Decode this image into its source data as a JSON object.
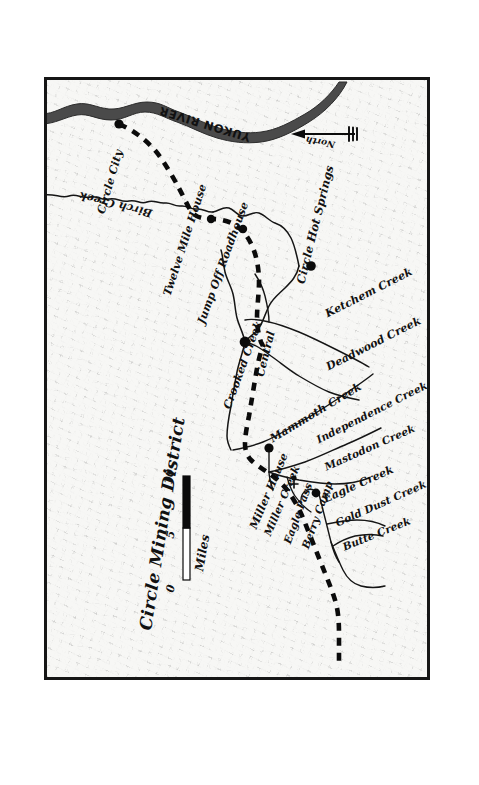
{
  "map": {
    "title": "Circle Mining District",
    "compass": {
      "label": "North",
      "direction": "left",
      "icon": "north-arrow-icon"
    },
    "scale_bar": {
      "unit": "Miles",
      "ticks": [
        "0",
        "5",
        "10"
      ],
      "segments": [
        {
          "from": "0",
          "to": "5",
          "fill": "white"
        },
        {
          "from": "5",
          "to": "10",
          "fill": "black"
        }
      ]
    },
    "water_features": [
      {
        "name": "YUKON RIVER",
        "type": "river",
        "style": "wide-filled"
      },
      {
        "name": "Birch Creek",
        "type": "creek"
      },
      {
        "name": "Crooked Creek",
        "type": "creek"
      },
      {
        "name": "Ketchem Creek",
        "type": "creek"
      },
      {
        "name": "Deadwood Creek",
        "type": "creek"
      },
      {
        "name": "Mammoth Creek",
        "type": "creek"
      },
      {
        "name": "Independence Creek",
        "type": "creek"
      },
      {
        "name": "Mastodon Creek",
        "type": "creek"
      },
      {
        "name": "Eagle Creek",
        "type": "creek"
      },
      {
        "name": "Gold Dust Creek",
        "type": "creek"
      },
      {
        "name": "Butte Creek",
        "type": "creek"
      },
      {
        "name": "Miller Creek",
        "type": "creek"
      }
    ],
    "settlements": [
      {
        "name": "Circle City",
        "marker": "dot"
      },
      {
        "name": "Twelve Mile House",
        "marker": "dot"
      },
      {
        "name": "Jump Off Roadhouse",
        "marker": "dot"
      },
      {
        "name": "Central",
        "marker": "dot"
      },
      {
        "name": "Circle Hot Springs",
        "marker": "dot"
      },
      {
        "name": "Miller House",
        "marker": "dot"
      },
      {
        "name": "Eagle Pass",
        "marker": "pass-symbol"
      },
      {
        "name": "Berry Camp",
        "marker": "dot"
      }
    ],
    "routes": [
      {
        "name": "Circle City Trail",
        "style": "dashed-heavy"
      }
    ],
    "colors": {
      "ink": "#111111",
      "border": "#161616",
      "river_fill": "#4a4a4a",
      "paper": "#f7f7f5"
    }
  },
  "labels": {
    "yukon_river": "YUKON RIVER",
    "circle_city": "Circle City",
    "birch_creek": "Birch Creek",
    "twelve_mile_house": "Twelve Mile House",
    "jump_off_roadhouse": "Jump Off Roadhouse",
    "crooked_creek": "Crooked Creek",
    "central": "Central",
    "circle_hot_springs": "Circle Hot Springs",
    "ketchem_creek": "Ketchem Creek",
    "deadwood_creek": "Deadwood Creek",
    "mammoth_creek": "Mammoth Creek",
    "independence_creek": "Independence Creek",
    "mastodon_creek": "Mastodon Creek",
    "miller_house": "Miller House",
    "miller_creek": "Miller Creek",
    "eagle_pass": "Eagle Pass",
    "berry_camp": "Berry Camp",
    "eagle_creek": "Eagle Creek",
    "gold_dust_creek": "Gold Dust Creek",
    "butte_creek": "Butte Creek",
    "title": "Circle Mining District",
    "north": "North",
    "miles": "Miles",
    "scale_0": "0",
    "scale_5": "5",
    "scale_10": "10"
  }
}
